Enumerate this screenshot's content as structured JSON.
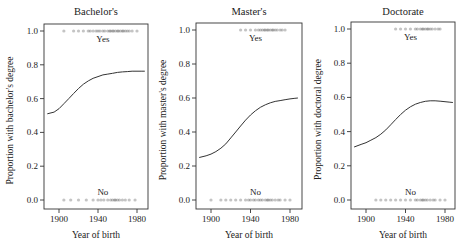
{
  "chart_data": [
    {
      "type": "line",
      "title": "Bachelor's",
      "xlabel": "Year of birth",
      "ylabel": "Proportion with bachelor's degree",
      "xticks": [
        1900,
        1940,
        1980
      ],
      "yticks": [
        "0.0",
        "0.2",
        "0.4",
        "0.6",
        "0.8",
        "1.0"
      ],
      "xlim": [
        1885,
        1991
      ],
      "ylim": [
        -0.03,
        1.03
      ],
      "grid": false,
      "annotations": {
        "yes": "Yes",
        "no": "No"
      },
      "series": [
        {
          "name": "fitted probability",
          "x": [
            1888,
            1895,
            1900,
            1905,
            1910,
            1915,
            1920,
            1925,
            1930,
            1935,
            1940,
            1945,
            1950,
            1955,
            1960,
            1965,
            1970,
            1975,
            1980,
            1985,
            1988
          ],
          "y": [
            0.51,
            0.52,
            0.54,
            0.57,
            0.6,
            0.63,
            0.66,
            0.685,
            0.705,
            0.72,
            0.73,
            0.74,
            0.745,
            0.75,
            0.755,
            0.758,
            0.76,
            0.762,
            0.762,
            0.762,
            0.762
          ]
        }
      ],
      "rug_yes_years": [
        1905,
        1915,
        1920,
        1925,
        1930,
        1932,
        1935,
        1938,
        1940,
        1942,
        1945,
        1947,
        1950,
        1952,
        1953,
        1955,
        1956,
        1958,
        1960,
        1961,
        1963,
        1965,
        1966,
        1968,
        1970,
        1972,
        1975,
        1980
      ],
      "rug_no_years": [
        1905,
        1912,
        1920,
        1928,
        1935,
        1940,
        1943,
        1946,
        1950,
        1953,
        1955,
        1957,
        1958,
        1960,
        1962,
        1965,
        1968,
        1972,
        1978
      ]
    },
    {
      "type": "line",
      "title": "Master's",
      "xlabel": "Year of birth",
      "ylabel": "Proportion with master's degree",
      "xticks": [
        1900,
        1940,
        1980
      ],
      "yticks": [
        "0.0",
        "0.2",
        "0.4",
        "0.6",
        "0.8",
        "1.0"
      ],
      "xlim": [
        1885,
        1991
      ],
      "ylim": [
        -0.03,
        1.03
      ],
      "grid": false,
      "annotations": {
        "yes": "Yes",
        "no": "No"
      },
      "series": [
        {
          "name": "fitted probability",
          "x": [
            1888,
            1895,
            1900,
            1905,
            1910,
            1915,
            1920,
            1925,
            1930,
            1935,
            1940,
            1945,
            1950,
            1955,
            1960,
            1965,
            1970,
            1975,
            1980,
            1985,
            1988
          ],
          "y": [
            0.25,
            0.26,
            0.27,
            0.285,
            0.305,
            0.33,
            0.365,
            0.4,
            0.435,
            0.47,
            0.5,
            0.525,
            0.545,
            0.56,
            0.572,
            0.58,
            0.585,
            0.59,
            0.595,
            0.598,
            0.6
          ]
        }
      ],
      "rug_yes_years": [
        1930,
        1935,
        1940,
        1945,
        1948,
        1950,
        1952,
        1954,
        1955,
        1957,
        1958,
        1960,
        1962,
        1963,
        1965,
        1967,
        1970,
        1972,
        1975
      ],
      "rug_no_years": [
        1900,
        1910,
        1915,
        1920,
        1925,
        1930,
        1935,
        1938,
        1940,
        1943,
        1945,
        1948,
        1950,
        1952,
        1955,
        1957,
        1958,
        1960,
        1962,
        1965,
        1968,
        1970,
        1975,
        1980
      ]
    },
    {
      "type": "line",
      "title": "Doctorate",
      "xlabel": "Year of birth",
      "ylabel": "Proportion with doctoral degree",
      "xticks": [
        1900,
        1940,
        1980
      ],
      "yticks": [
        "0.0",
        "0.2",
        "0.4",
        "0.6",
        "0.8",
        "1.0"
      ],
      "xlim": [
        1885,
        1991
      ],
      "ylim": [
        -0.03,
        1.03
      ],
      "grid": false,
      "annotations": {
        "yes": "Yes",
        "no": "No"
      },
      "series": [
        {
          "name": "fitted probability",
          "x": [
            1888,
            1895,
            1900,
            1905,
            1910,
            1915,
            1920,
            1925,
            1930,
            1935,
            1940,
            1945,
            1950,
            1955,
            1960,
            1965,
            1970,
            1975,
            1980,
            1985,
            1988
          ],
          "y": [
            0.31,
            0.325,
            0.335,
            0.35,
            0.365,
            0.385,
            0.41,
            0.44,
            0.47,
            0.5,
            0.525,
            0.545,
            0.56,
            0.57,
            0.577,
            0.58,
            0.58,
            0.578,
            0.575,
            0.572,
            0.57
          ]
        }
      ],
      "rug_yes_years": [
        1930,
        1935,
        1940,
        1945,
        1950,
        1952,
        1955,
        1957,
        1958,
        1960,
        1962,
        1963,
        1965,
        1967,
        1970,
        1973,
        1975
      ],
      "rug_no_years": [
        1910,
        1915,
        1920,
        1925,
        1930,
        1935,
        1940,
        1945,
        1950,
        1952,
        1955,
        1957,
        1958,
        1960,
        1962,
        1965,
        1968,
        1970,
        1975,
        1980
      ]
    }
  ],
  "colors": {
    "axis": "#333333",
    "curve": "#333333",
    "rug": "#555555",
    "text": "#222222"
  }
}
